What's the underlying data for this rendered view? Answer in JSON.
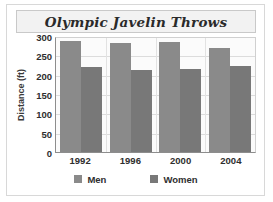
{
  "chart_data": {
    "type": "bar",
    "title": "Olympic Javelin Throws",
    "xlabel": "",
    "ylabel": "Distance (ft)",
    "categories": [
      "1992",
      "1996",
      "2000",
      "2004"
    ],
    "series": [
      {
        "name": "Men",
        "values": [
          288,
          281,
          285,
          270
        ],
        "color": "#8a8a8a"
      },
      {
        "name": "Women",
        "values": [
          219,
          212,
          214,
          222
        ],
        "color": "#787878"
      }
    ],
    "ylim": [
      0,
      300
    ],
    "yticks": [
      0,
      50,
      100,
      150,
      200,
      250,
      300
    ],
    "ytick_labels": [
      "0",
      "50",
      "100",
      "150",
      "200",
      "250",
      "300"
    ],
    "grid": true,
    "legend_position": "bottom"
  },
  "legend": {
    "items": [
      {
        "label": "Men"
      },
      {
        "label": "Women"
      }
    ]
  }
}
